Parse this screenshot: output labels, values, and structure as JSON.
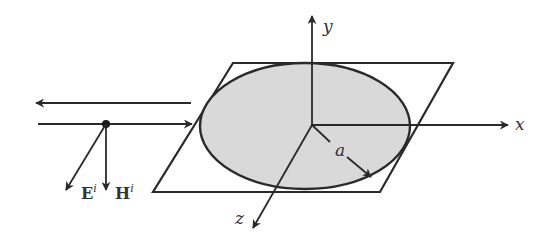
{
  "diagram": {
    "title": "",
    "axes": {
      "x_label": "x",
      "y_label": "y",
      "z_label": "z"
    },
    "radius_label": "a",
    "incident_field": {
      "E_label": "E",
      "E_superscript": "i",
      "H_label": "H",
      "H_superscript": "i"
    },
    "colors": {
      "line": "#2a2a2a",
      "disk_fill": "#d9d9d9",
      "background": "#ffffff"
    }
  }
}
